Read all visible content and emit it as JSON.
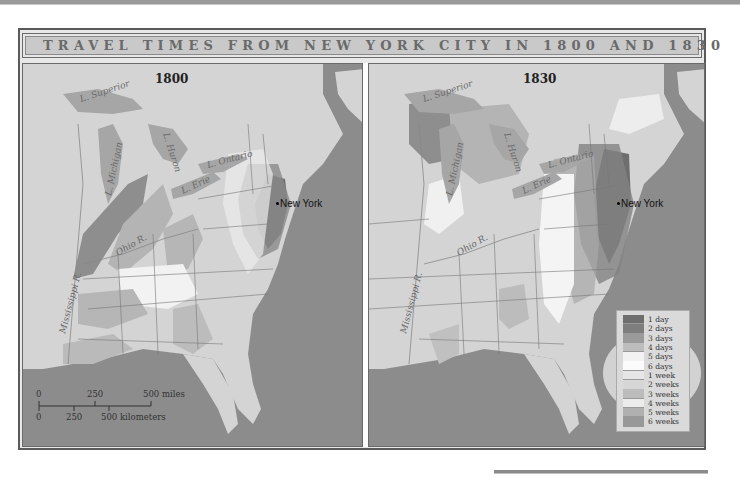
{
  "title": "TRAVEL TIMES FROM NEW YORK CITY IN 1800 AND 1830",
  "maps": [
    {
      "year": "1800",
      "city": "New York",
      "labels": {
        "superior": "L. Superior",
        "michigan": "L. Michigan",
        "huron": "L. Huron",
        "erie": "L. Erie",
        "ontario": "L. Ontario",
        "ohio": "Ohio R.",
        "mississippi": "Mississippi R."
      }
    },
    {
      "year": "1830",
      "city": "New York",
      "labels": {
        "superior": "L. Superior",
        "michigan": "L. Michigan",
        "huron": "L. Huron",
        "erie": "L. Erie",
        "ontario": "L. Ontario",
        "ohio": "Ohio R.",
        "mississippi": "Mississippi R."
      }
    }
  ],
  "legend": {
    "items": [
      {
        "label": "1 day",
        "color": "#6e6e6e"
      },
      {
        "label": "2 days",
        "color": "#7e7e7e"
      },
      {
        "label": "3 days",
        "color": "#9a9a9a"
      },
      {
        "label": "4 days",
        "color": "#bdbdbd"
      },
      {
        "label": "5 days",
        "color": "#f2f2f2"
      },
      {
        "label": "6 days",
        "color": "#fbfbfb"
      },
      {
        "label": "1 week",
        "color": "#e6e6e6"
      },
      {
        "label": "2 weeks",
        "color": "#d6d6d6"
      },
      {
        "label": "3 weeks",
        "color": "#bcbcbc"
      },
      {
        "label": "4 weeks",
        "color": "#ececec"
      },
      {
        "label": "5 weeks",
        "color": "#b0b0b0"
      },
      {
        "label": "6 weeks",
        "color": "#989898"
      }
    ]
  },
  "scale_bar": {
    "miles": {
      "ticks": [
        "0",
        "250",
        "500 miles"
      ]
    },
    "kilometers": {
      "ticks": [
        "0",
        "250",
        "500 kilometers"
      ]
    }
  },
  "colors": {
    "ocean": "#8c8c8c",
    "land": "#d4d4d4",
    "lake": "#a6a6a6",
    "title_bg": "#c9c9c9",
    "title_text": "#6a6a6a"
  }
}
